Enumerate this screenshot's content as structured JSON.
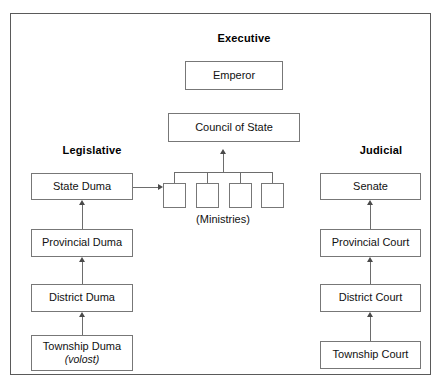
{
  "diagram": {
    "frame_color": "#5a5a5a",
    "box_border_color": "#777777",
    "connector_color": "#6d6d6d",
    "background": "#ffffff"
  },
  "columns": {
    "executive": {
      "heading": "Executive"
    },
    "legislative": {
      "heading": "Legislative"
    },
    "judicial": {
      "heading": "Judicial"
    }
  },
  "nodes": {
    "emperor": {
      "label": "Emperor"
    },
    "council_of_state": {
      "label": "Council of State"
    },
    "ministries_caption": {
      "label": "(Ministries)"
    },
    "state_duma": {
      "label": "State Duma"
    },
    "provincial_duma": {
      "label": "Provincial Duma"
    },
    "district_duma": {
      "label": "District Duma"
    },
    "township_duma": {
      "label": "Township Duma",
      "sublabel": "(volost)"
    },
    "senate": {
      "label": "Senate"
    },
    "provincial_court": {
      "label": "Provincial Court"
    },
    "district_court": {
      "label": "District Court"
    },
    "township_court": {
      "label": "Township Court"
    }
  },
  "ministries": [
    {
      "label": ""
    },
    {
      "label": ""
    },
    {
      "label": ""
    },
    {
      "label": ""
    }
  ],
  "connectors": [
    {
      "from": "ministries_bus",
      "to": "council_of_state",
      "type": "arrow-up"
    },
    {
      "from": "state_duma",
      "to": "ministries",
      "type": "arrow-right"
    },
    {
      "from": "provincial_duma",
      "to": "state_duma",
      "type": "arrow-up"
    },
    {
      "from": "district_duma",
      "to": "provincial_duma",
      "type": "arrow-up"
    },
    {
      "from": "township_duma",
      "to": "district_duma",
      "type": "arrow-up"
    },
    {
      "from": "provincial_court",
      "to": "senate",
      "type": "arrow-up"
    },
    {
      "from": "district_court",
      "to": "provincial_court",
      "type": "arrow-up"
    },
    {
      "from": "township_court",
      "to": "district_court",
      "type": "arrow-up"
    }
  ]
}
